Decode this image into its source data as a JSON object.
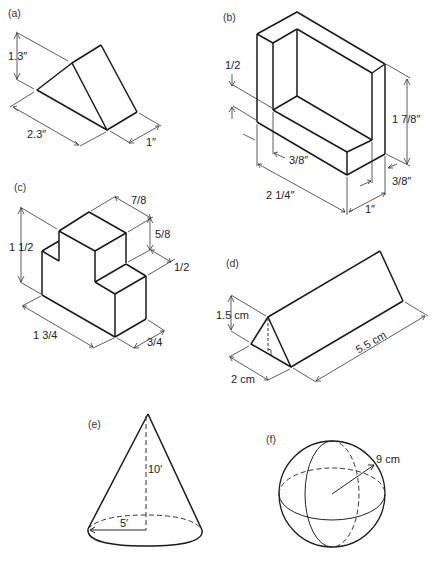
{
  "figures": {
    "a": {
      "label": "(a)",
      "shape": "triangular wedge",
      "dimensions": {
        "height": "1.3″",
        "length": "2.3″",
        "width": "1″"
      }
    },
    "b": {
      "label": "(b)",
      "shape": "L-shaped bracket block",
      "dimensions": {
        "base_thickness": "1/2",
        "inner_depth": "3/8″",
        "height": "1 7/8″",
        "wall_thickness": "3/8″",
        "length": "2 1/4″",
        "width": "1″"
      }
    },
    "c": {
      "label": "(c)",
      "shape": "stepped block",
      "dimensions": {
        "height": "1 1/2",
        "top_depth": "7/8",
        "step_height": "5/8",
        "step_depth": "1/2",
        "length": "1 3/4",
        "width": "3/4"
      }
    },
    "d": {
      "label": "(d)",
      "shape": "triangular prism",
      "dimensions": {
        "height": "1.5 cm",
        "base": "2 cm",
        "length": "5.5 cm"
      }
    },
    "e": {
      "label": "(e)",
      "shape": "cone",
      "dimensions": {
        "height": "10′",
        "radius": "5′"
      }
    },
    "f": {
      "label": "(f)",
      "shape": "sphere",
      "dimensions": {
        "radius": "9 cm"
      }
    }
  },
  "colors": {
    "line": "#1a1a1a",
    "background": "#ffffff"
  }
}
